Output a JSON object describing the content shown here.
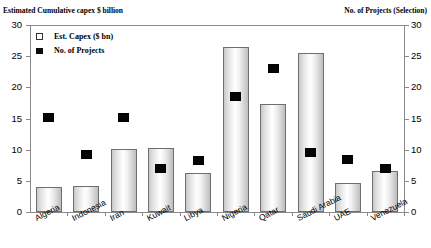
{
  "chart_data": {
    "type": "bar",
    "title": "",
    "left_axis_title": "Estimated Cumulative capex $ billion",
    "right_axis_title": "No. of Projects (Selection)",
    "categories": [
      "Algeria",
      "Indonesia",
      "Iran",
      "Kuwait",
      "Libya",
      "Nigeria",
      "Qatar",
      "Saudi Arabia",
      "UAE",
      "Venezuela"
    ],
    "series": [
      {
        "name": "Est. Capex ($ bn)",
        "type": "bar",
        "axis": "left",
        "values": [
          4.0,
          4.1,
          10.1,
          10.2,
          6.2,
          26.5,
          17.3,
          25.5,
          4.7,
          6.5
        ]
      },
      {
        "name": "No. of Projects",
        "type": "scatter",
        "axis": "right",
        "values": [
          15.1,
          9.2,
          15.2,
          7.0,
          8.3,
          18.5,
          23.0,
          9.5,
          8.5,
          7.0
        ]
      }
    ],
    "xlabel": "",
    "ylabel": "Estimated Cumulative capex $ billion",
    "y2label": "No. of Projects (Selection)",
    "ylim": [
      0,
      30
    ],
    "y2lim": [
      0,
      30
    ],
    "yticks": [
      0,
      5,
      10,
      15,
      20,
      25,
      30
    ],
    "y2ticks": [
      0,
      5,
      10,
      15,
      20,
      25,
      30
    ],
    "grid": false,
    "legend_position": "top-left",
    "legend": [
      {
        "label": "Est. Capex ($ bn)",
        "marker": "open-square"
      },
      {
        "label": "No. of Projects",
        "marker": "filled-square"
      }
    ],
    "colors": {
      "bar_fill": "#e6e6e6",
      "bar_edge": "#6e6e6e",
      "marker": "#050505",
      "axis": "#8a8a8a"
    }
  }
}
